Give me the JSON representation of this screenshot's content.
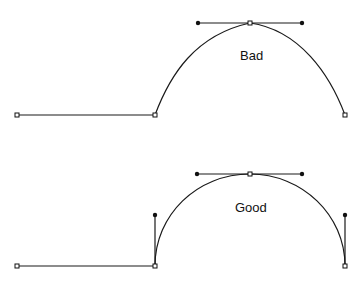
{
  "colors": {
    "background": "#ffffff",
    "stroke": "#1a1a1a"
  },
  "figures": {
    "bad": {
      "label": "Bad",
      "label_pos": {
        "x": 240,
        "y": 49
      },
      "left_anchor": {
        "x": 17,
        "y": 115
      },
      "join_anchor": {
        "x": 155,
        "y": 115
      },
      "top_anchor": {
        "x": 250,
        "y": 23
      },
      "right_anchor": {
        "x": 345,
        "y": 115
      },
      "top_handles": [
        {
          "x": 198,
          "y": 23
        },
        {
          "x": 302,
          "y": 23
        }
      ],
      "side_handles": []
    },
    "good": {
      "label": "Good",
      "label_pos": {
        "x": 235,
        "y": 201
      },
      "left_anchor": {
        "x": 17,
        "y": 266
      },
      "join_anchor": {
        "x": 155,
        "y": 266
      },
      "top_anchor": {
        "x": 250,
        "y": 174
      },
      "right_anchor": {
        "x": 345,
        "y": 266
      },
      "top_handles": [
        {
          "x": 197,
          "y": 174
        },
        {
          "x": 302,
          "y": 174
        }
      ],
      "side_handles": [
        {
          "x": 155,
          "y": 215
        },
        {
          "x": 345,
          "y": 215
        }
      ]
    }
  }
}
